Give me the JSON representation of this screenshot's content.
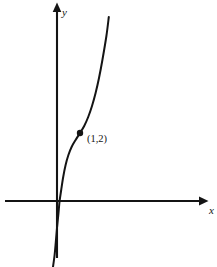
{
  "figure": {
    "width": 217,
    "height": 267,
    "background_color": "#ffffff",
    "ink_color": "#141414"
  },
  "axes": {
    "x_axis_label": "x",
    "y_axis_label": "y",
    "x_label_pos": {
      "x": 209,
      "y": 214
    },
    "y_label_pos": {
      "x": 62,
      "y": 16
    },
    "origin": {
      "x": 57,
      "y": 201
    },
    "x_axis_line": {
      "x1": 5,
      "y1": 201,
      "x2": 206,
      "y2": 201
    },
    "y_axis_line": {
      "x1": 57,
      "y1": 5,
      "x2": 57,
      "y2": 258
    },
    "x_arrow_tip": {
      "x": 208,
      "y": 201
    },
    "y_arrow_tip": {
      "x": 57,
      "y": 3
    },
    "ticks": [],
    "grid": false
  },
  "annotations": {
    "point_label": "(1,2)",
    "point_label_pos": {
      "x": 87,
      "y": 142
    },
    "marker_pos": {
      "x": 80,
      "y": 133
    },
    "marker_radius": 3.2
  },
  "chart_data": {
    "type": "line",
    "title": "",
    "subtitle": "",
    "xlabel": "x",
    "ylabel": "y",
    "grid": false,
    "legend": null,
    "xlim": [
      -1.1,
      3.0
    ],
    "ylim": [
      -4.0,
      6.0
    ],
    "series": [
      {
        "name": "cubic-curve",
        "comment": "Increasing cubic-like curve with an inflection point at the marked point (1,2); passes near the origin and rises steeply.",
        "marked_points": [
          {
            "label": "(1,2)",
            "x": 1,
            "y": 2
          }
        ],
        "x": [
          -0.52,
          -0.4,
          -0.3,
          -0.2,
          -0.1,
          0.0,
          0.12,
          0.25,
          0.4,
          0.55,
          0.7,
          0.85,
          1.0,
          1.15,
          1.3,
          1.45,
          1.6,
          1.75,
          1.9,
          2.05,
          2.1
        ],
        "y": [
          -3.6,
          -2.75,
          -2.05,
          -1.38,
          -0.7,
          -0.05,
          0.35,
          0.72,
          1.05,
          1.33,
          1.58,
          1.8,
          2.0,
          2.24,
          2.54,
          2.92,
          3.38,
          3.94,
          4.6,
          5.35,
          5.65
        ],
        "pixel_path": [
          {
            "x": 53.0,
            "y": 267.0
          },
          {
            "x": 54.6,
            "y": 255.0
          },
          {
            "x": 55.8,
            "y": 242.0
          },
          {
            "x": 57.0,
            "y": 228.0
          },
          {
            "x": 58.4,
            "y": 214.0
          },
          {
            "x": 59.6,
            "y": 201.0
          },
          {
            "x": 61.2,
            "y": 190.0
          },
          {
            "x": 63.2,
            "y": 177.0
          },
          {
            "x": 65.6,
            "y": 165.0
          },
          {
            "x": 68.4,
            "y": 155.0
          },
          {
            "x": 71.6,
            "y": 147.0
          },
          {
            "x": 75.6,
            "y": 140.0
          },
          {
            "x": 80.0,
            "y": 133.0
          },
          {
            "x": 84.2,
            "y": 126.0
          },
          {
            "x": 88.2,
            "y": 117.0
          },
          {
            "x": 92.0,
            "y": 106.0
          },
          {
            "x": 95.6,
            "y": 93.0
          },
          {
            "x": 99.0,
            "y": 78.0
          },
          {
            "x": 102.4,
            "y": 60.0
          },
          {
            "x": 106.4,
            "y": 36.0
          },
          {
            "x": 108.8,
            "y": 17.0
          }
        ]
      }
    ]
  }
}
